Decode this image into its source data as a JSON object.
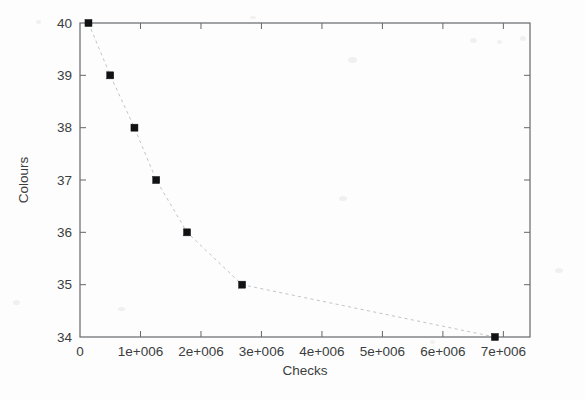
{
  "chart_data": {
    "type": "scatter",
    "title": "",
    "xlabel": "Checks",
    "ylabel": "Colours",
    "xlim": [
      0,
      7440000
    ],
    "ylim": [
      34,
      40
    ],
    "grid": false,
    "legend": null,
    "marker_style": "filled-square",
    "line_style": "dashed-light-gray",
    "x_tick_labels": [
      "0",
      "1e+006",
      "2e+006",
      "3e+006",
      "4e+006",
      "5e+006",
      "6e+006",
      "7e+006"
    ],
    "x_tick_values": [
      0,
      1000000,
      2000000,
      3000000,
      4000000,
      5000000,
      6000000,
      7000000
    ],
    "y_tick_labels": [
      "34",
      "35",
      "36",
      "37",
      "38",
      "39",
      "40"
    ],
    "y_tick_values": [
      34,
      35,
      36,
      37,
      38,
      39,
      40
    ],
    "x": [
      140000,
      500000,
      900000,
      1260000,
      1770000,
      2680000,
      6860000
    ],
    "values": [
      40,
      39,
      38,
      37,
      36,
      35,
      34
    ],
    "points": [
      {
        "checks": 140000,
        "colours": 40
      },
      {
        "checks": 500000,
        "colours": 39
      },
      {
        "checks": 900000,
        "colours": 38
      },
      {
        "checks": 1260000,
        "colours": 37
      },
      {
        "checks": 1770000,
        "colours": 36
      },
      {
        "checks": 2680000,
        "colours": 35
      },
      {
        "checks": 6860000,
        "colours": 34
      }
    ]
  },
  "colors": {
    "background": "#fdfdfd",
    "axis": "#5f6164",
    "marker": "#111214",
    "line": "#b9bcc0",
    "text": "#3b3d40"
  }
}
